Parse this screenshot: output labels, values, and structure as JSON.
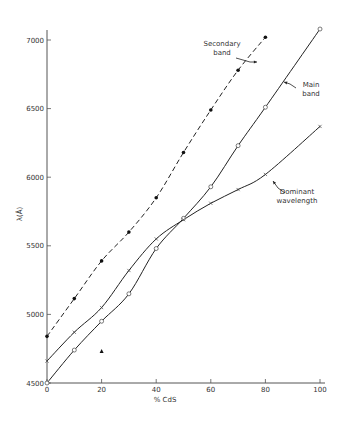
{
  "chart_data": {
    "type": "line",
    "title": "",
    "xlabel": "% CdS",
    "ylabel": "λ(Å)",
    "xlim": [
      0,
      100
    ],
    "ylim": [
      4500,
      7000
    ],
    "xticks": [
      0,
      20,
      40,
      60,
      80,
      100
    ],
    "yticks": [
      4500,
      5000,
      5500,
      6000,
      6500,
      7000
    ],
    "grid": false,
    "legend": "inline annotations",
    "series": [
      {
        "name": "Secondary band",
        "style": "dashed",
        "marker": "filled-circle",
        "x": [
          0,
          10,
          20,
          30,
          40,
          50,
          60,
          70,
          80
        ],
        "values": [
          4840,
          5115,
          5390,
          5600,
          5850,
          6180,
          6490,
          6780,
          7020
        ]
      },
      {
        "name": "Main band",
        "style": "solid",
        "marker": "open-circle",
        "x": [
          0,
          10,
          20,
          30,
          40,
          50,
          60,
          70,
          80,
          100
        ],
        "values": [
          4500,
          4740,
          4950,
          5150,
          5480,
          5700,
          5930,
          6230,
          6510,
          7080
        ]
      },
      {
        "name": "Dominant wavelength",
        "style": "solid",
        "marker": "x",
        "x": [
          0,
          10,
          20,
          30,
          40,
          50,
          60,
          70,
          80,
          100
        ],
        "values": [
          4660,
          4870,
          5050,
          5320,
          5550,
          5690,
          5810,
          5910,
          6020,
          6370
        ]
      }
    ],
    "outliers": [
      {
        "x": 20,
        "y": 4730,
        "marker": "filled-triangle"
      }
    ],
    "annotations": [
      {
        "text_lines": [
          "Secondary",
          "band"
        ],
        "target": "Secondary band"
      },
      {
        "text_lines": [
          "Main",
          "band"
        ],
        "target": "Main band"
      },
      {
        "text_lines": [
          "Dominant",
          "wavelength"
        ],
        "target": "Dominant wavelength"
      }
    ]
  }
}
